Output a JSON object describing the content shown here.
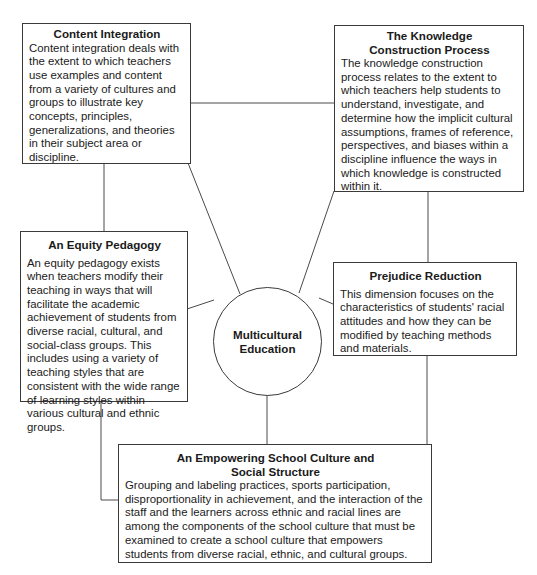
{
  "diagram": {
    "center": {
      "label_line1": "Multicultural",
      "label_line2": "Education"
    },
    "nodes": [
      {
        "id": "content-integration",
        "title": "Content Integration",
        "body": "Content integration deals with the extent to which teachers use examples and content from a variety of cultures and groups to illustrate key concepts, principles, generalizations, and theories in their subject area or discipline."
      },
      {
        "id": "knowledge-construction",
        "title": "The Knowledge Construction Process",
        "body": "The knowledge construction process relates to the extent to which teachers help students to understand, investigate, and determine how the implicit cultural assumptions, frames of reference, perspectives, and biases within a discipline influence the ways in which knowledge is constructed within it."
      },
      {
        "id": "equity-pedagogy",
        "title": "An Equity Pedagogy",
        "body": "An equity pedagogy exists when teachers modify their teaching in ways that will facilitate the academic achievement of students from diverse racial, cultural, and social-class groups. This includes using a variety of teaching styles that are consistent with the wide range of learning styles within various cultural and ethnic groups."
      },
      {
        "id": "prejudice-reduction",
        "title": "Prejudice Reduction",
        "body": "This dimension focuses on the characteristics of students' racial attitudes and how they can be modified by teaching methods and materials."
      },
      {
        "id": "empowering-school-culture",
        "title": "An Empowering School Culture and Social Structure",
        "body": "Grouping and labeling practices, sports participation, disproportionality in achievement, and the interaction of the staff and the learners across ethnic and racial lines are among the components of the school culture that must be examined to create a school culture that empowers students from diverse racial, ethnic, and cultural groups."
      }
    ]
  }
}
